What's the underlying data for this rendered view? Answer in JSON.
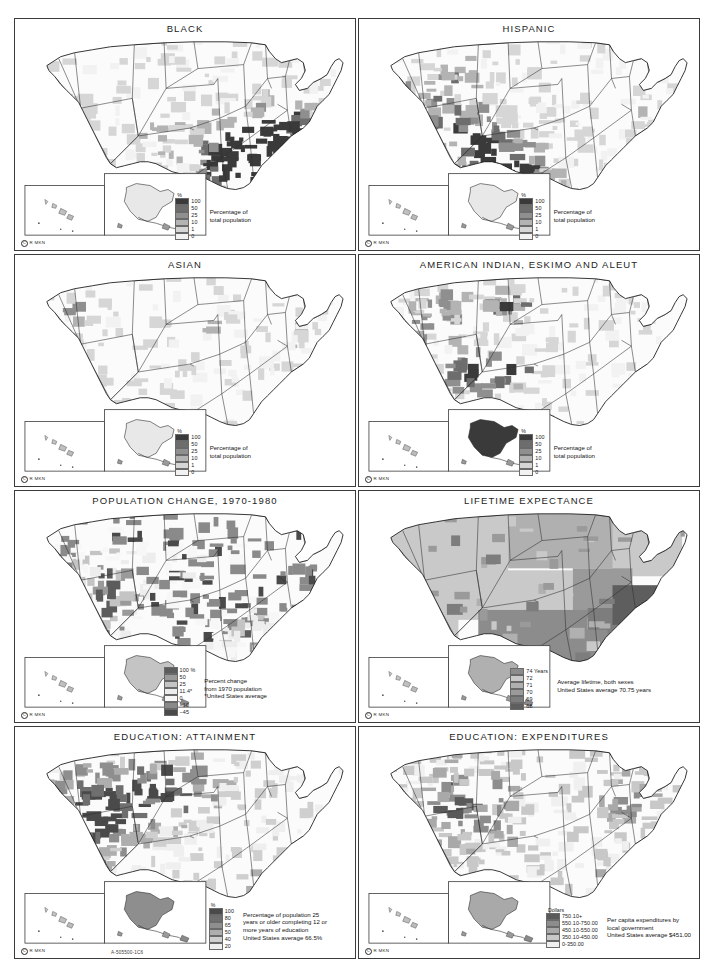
{
  "document": {
    "plate_code": "A-505500-1C6",
    "copyright_mark": "C",
    "copyright_text": "R  MKN"
  },
  "legend_common": {
    "unit_percent": "%",
    "description_population": "Percentage of\ntotal population",
    "desc_pop_line1": "Percentage of",
    "desc_pop_line2": "total population",
    "values": [
      "100",
      "50",
      "25",
      "10",
      "1",
      "0"
    ],
    "colors": [
      "#3a3a3a",
      "#6d6d6d",
      "#8f8f8f",
      "#b3b3b3",
      "#d6d6d6",
      "#f2f2f2"
    ]
  },
  "panels": [
    {
      "id": "black",
      "title": "BLACK",
      "legend": {
        "unit": "%",
        "values": [
          "100",
          "50",
          "25",
          "10",
          "1",
          "0"
        ],
        "colors": [
          "#3a3a3a",
          "#6d6d6d",
          "#8f8f8f",
          "#b3b3b3",
          "#d6d6d6",
          "#f2f2f2"
        ],
        "desc_lines": [
          "Percentage of",
          "total population"
        ]
      }
    },
    {
      "id": "hispanic",
      "title": "HISPANIC",
      "legend": {
        "unit": "%",
        "values": [
          "100",
          "50",
          "25",
          "10",
          "1",
          "0"
        ],
        "colors": [
          "#3a3a3a",
          "#6d6d6d",
          "#8f8f8f",
          "#b3b3b3",
          "#d6d6d6",
          "#f2f2f2"
        ],
        "desc_lines": [
          "Percentage of",
          "total population"
        ]
      }
    },
    {
      "id": "asian",
      "title": "ASIAN",
      "legend": {
        "unit": "%",
        "values": [
          "100",
          "50",
          "25",
          "10",
          "1",
          "0"
        ],
        "colors": [
          "#3a3a3a",
          "#6d6d6d",
          "#8f8f8f",
          "#b3b3b3",
          "#d6d6d6",
          "#f2f2f2"
        ],
        "desc_lines": [
          "Percentage of",
          "total population"
        ]
      }
    },
    {
      "id": "american-indian",
      "title": "AMERICAN INDIAN, ESKIMO AND ALEUT",
      "legend": {
        "unit": "%",
        "values": [
          "100",
          "50",
          "25",
          "10",
          "1",
          "0"
        ],
        "colors": [
          "#3a3a3a",
          "#6d6d6d",
          "#8f8f8f",
          "#b3b3b3",
          "#d6d6d6",
          "#f2f2f2"
        ],
        "desc_lines": [
          "Percentage of",
          "total population"
        ]
      }
    },
    {
      "id": "population-change",
      "title": "POPULATION CHANGE, 1970-1980",
      "legend": {
        "unit": "",
        "values": [
          "100 %",
          "50",
          "25",
          "11.4*",
          "0",
          "−10",
          "−45"
        ],
        "colors": [
          "#5c5c5c",
          "#9a9a9a",
          "#c4c4c4",
          "#ededed",
          "#f7f7f7",
          "#8a8a8a",
          "#4a4a4a"
        ],
        "desc_lines": [
          "Percent change",
          "from 1970 population",
          "*United States average"
        ]
      }
    },
    {
      "id": "lifetime-expectance",
      "title": "LIFETIME EXPECTANCE",
      "legend": {
        "unit": "",
        "values": [
          "74 Years",
          "72",
          "71",
          "70",
          "69",
          "68"
        ],
        "colors": [
          "#8c8c8c",
          "#c9c9c9",
          "#b0b0b0",
          "#9a9a9a",
          "#7d7d7d",
          "#5e5e5e"
        ],
        "desc_lines": [
          "Average lifetime, both sexes",
          "United States average 70.75 years"
        ]
      }
    },
    {
      "id": "education-attainment",
      "title": "EDUCATION: ATTAINMENT",
      "legend": {
        "unit": "%",
        "values": [
          "100",
          "80",
          "65",
          "50",
          "40",
          "20"
        ],
        "colors": [
          "#4a4a4a",
          "#6f6f6f",
          "#8e8e8e",
          "#aeaeae",
          "#cfcfcf",
          "#efefef"
        ],
        "desc_lines": [
          "Percentage of population 25",
          "years or older completing 12 or",
          "more years of education",
          "United States average 66.5%"
        ]
      }
    },
    {
      "id": "education-expenditures",
      "title": "EDUCATION: EXPENDITURES",
      "legend": {
        "unit": "Dollars",
        "values": [
          "750.10+",
          "550.10-750.00",
          "450.10-550.00",
          "350.10-450.00",
          "0-350.00"
        ],
        "colors": [
          "#5a5a5a",
          "#8d8d8d",
          "#a9a9a9",
          "#c8c8c8",
          "#f0f0f0"
        ],
        "desc_lines": [
          "Per capita expenditures by",
          "local government",
          "United States average $451.00"
        ]
      }
    }
  ]
}
